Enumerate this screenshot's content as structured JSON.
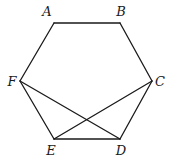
{
  "figure": {
    "type": "hexagon-with-diagonals",
    "vertices": [
      "A",
      "B",
      "C",
      "D",
      "E",
      "F"
    ],
    "sides": [
      [
        "A",
        "B"
      ],
      [
        "B",
        "C"
      ],
      [
        "C",
        "D"
      ],
      [
        "D",
        "E"
      ],
      [
        "E",
        "F"
      ],
      [
        "F",
        "A"
      ]
    ],
    "diagonals": [
      [
        "F",
        "D"
      ],
      [
        "C",
        "E"
      ]
    ],
    "labels": {
      "A": "A",
      "B": "B",
      "C": "C",
      "D": "D",
      "E": "E",
      "F": "F"
    },
    "line_color": "#1a1a1a"
  }
}
